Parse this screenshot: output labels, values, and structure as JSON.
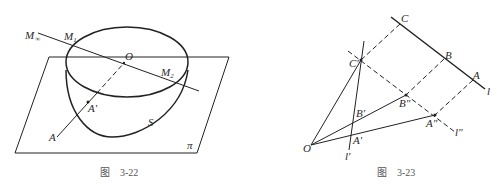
{
  "figures": [
    {
      "id": "fig-3-22",
      "caption_prefix": "图",
      "caption_number": "3-22",
      "labels": {
        "m_inf": "M",
        "m_inf_sub": "∞",
        "m1": "M",
        "m1_sub": "1",
        "o": "O",
        "m2": "M",
        "m2_sub": "2",
        "a_prime": "A'",
        "s": "S",
        "a": "A",
        "pi": "π"
      }
    },
    {
      "id": "fig-3-23",
      "caption_prefix": "图",
      "caption_number": "3-23",
      "labels": {
        "c": "C",
        "b": "B",
        "a": "A",
        "l": "l",
        "c_prime": "C'",
        "b_dprime": "B\"",
        "a_dprime": "A\"",
        "l_dprime": "l\"",
        "b_prime": "B'",
        "a_prime": "A'",
        "o": "O",
        "l_prime": "l'"
      }
    }
  ]
}
